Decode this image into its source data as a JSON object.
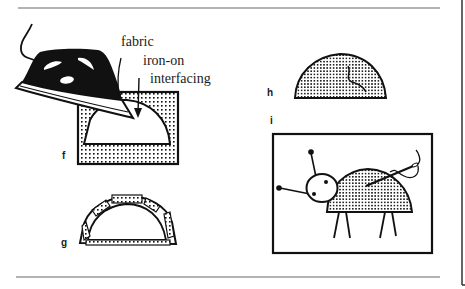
{
  "figure": {
    "panels": [
      {
        "id": "f",
        "label": "f",
        "description": "iron pressing iron-on interfacing onto fabric"
      },
      {
        "id": "g",
        "label": "g",
        "description": "half-circle shape with fabric edges folded over"
      },
      {
        "id": "h",
        "label": "h",
        "description": "finished half-circle fabric piece"
      },
      {
        "id": "i",
        "label": "i",
        "description": "ladybug picture being stitched with needle and thread"
      }
    ],
    "annotations": {
      "fabric": "fabric",
      "interfacing_line1": "iron-on",
      "interfacing_line2": "interfacing"
    },
    "colors": {
      "ink": "#111111",
      "rule": "#9a9a9a",
      "paper": "#ffffff"
    }
  }
}
